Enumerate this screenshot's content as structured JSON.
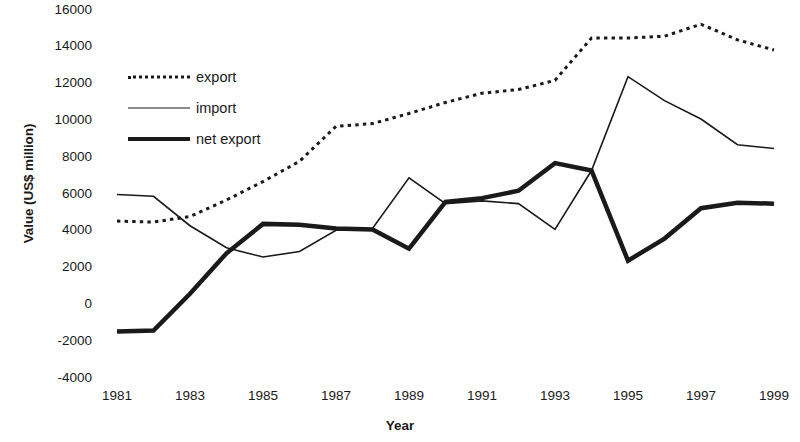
{
  "chart_data": {
    "type": "line",
    "title": "",
    "xlabel": "Year",
    "ylabel": "Value (US$ million)",
    "x": [
      1981,
      1982,
      1983,
      1984,
      1985,
      1986,
      1987,
      1988,
      1989,
      1990,
      1991,
      1992,
      1993,
      1994,
      1995,
      1996,
      1997,
      1998,
      1999
    ],
    "xtick_labels": [
      "1981",
      "1983",
      "1985",
      "1987",
      "1989",
      "1991",
      "1993",
      "1995",
      "1997",
      "1999"
    ],
    "xticks": [
      1981,
      1983,
      1985,
      1987,
      1989,
      1991,
      1993,
      1995,
      1997,
      1999
    ],
    "xlim": [
      1980.5,
      1999.5
    ],
    "ytick_labels": [
      "16000",
      "14000",
      "12000",
      "10000",
      "8000",
      "6000",
      "4000",
      "2000",
      "0",
      "-2000",
      "-4000"
    ],
    "yticks": [
      16000,
      14000,
      12000,
      10000,
      8000,
      6000,
      4000,
      2000,
      0,
      -2000,
      -4000
    ],
    "ylim": [
      -4000,
      16000
    ],
    "grid": false,
    "legend_position": "upper-left",
    "series": [
      {
        "name": "export",
        "style": "dotted",
        "color": "#1a1a1a",
        "width": 3,
        "values": [
          4450,
          4400,
          4700,
          5600,
          6600,
          7700,
          9600,
          9750,
          10300,
          10900,
          11400,
          11600,
          12100,
          14400,
          14400,
          14500,
          15150,
          14300,
          13750
        ]
      },
      {
        "name": "import",
        "style": "solid-thin",
        "color": "#1a1a1a",
        "width": 1.6,
        "values": [
          5900,
          5800,
          4200,
          3000,
          2500,
          2800,
          3950,
          4050,
          6800,
          5400,
          5550,
          5400,
          4000,
          7200,
          12300,
          11000,
          10000,
          8600,
          8400
        ]
      },
      {
        "name": "net export",
        "style": "solid-thick",
        "color": "#1a1a1a",
        "width": 4.5,
        "values": [
          -1550,
          -1500,
          500,
          2700,
          4300,
          4250,
          4050,
          4000,
          2950,
          5500,
          5700,
          6100,
          7600,
          7200,
          2300,
          3500,
          5150,
          5450,
          5400
        ]
      }
    ]
  },
  "legend": {
    "items": [
      {
        "label": "export",
        "swatch": "dotted-line-swatch"
      },
      {
        "label": "import",
        "swatch": "thin-line-swatch"
      },
      {
        "label": "net export",
        "swatch": "thick-line-swatch"
      }
    ]
  },
  "axes": {
    "x_title": "Year",
    "y_title": "Value (US$ million)"
  }
}
